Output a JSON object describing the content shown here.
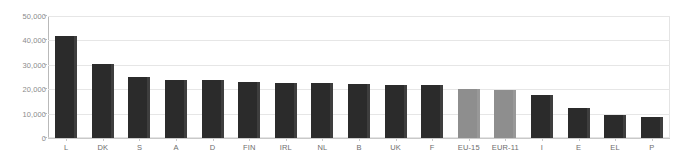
{
  "chart_data": {
    "type": "bar",
    "title": "",
    "subtitle": "",
    "xlabel": "",
    "ylabel": "",
    "ylim": [
      0,
      50000
    ],
    "ytick_labels": [
      "50,000",
      "40,000",
      "30,000",
      "20,000",
      "10,000",
      "0"
    ],
    "ytick_values": [
      50000,
      40000,
      30000,
      20000,
      10000,
      0
    ],
    "grid": true,
    "legend": "none",
    "categories": [
      "L",
      "DK",
      "S",
      "A",
      "D",
      "FIN",
      "IRL",
      "NL",
      "B",
      "UK",
      "F",
      "EU-15",
      "EUR-11",
      "I",
      "E",
      "EL",
      "P"
    ],
    "values": [
      42000,
      30500,
      25000,
      23800,
      23600,
      22800,
      22700,
      22600,
      22100,
      21800,
      21600,
      20200,
      19800,
      17700,
      12400,
      9400,
      8800
    ],
    "bar_colors": [
      "dark",
      "dark",
      "dark",
      "dark",
      "dark",
      "dark",
      "dark",
      "dark",
      "dark",
      "dark",
      "dark",
      "gray",
      "gray",
      "dark",
      "dark",
      "dark",
      "dark"
    ],
    "colors": {
      "bar_dark": "#2b2b2b",
      "bar_gray": "#8e8e8e",
      "gridline": "#e6e6e6",
      "axis": "#b9b9b9",
      "tick_text": "#8b8b8b",
      "category_text": "#6e6e6e",
      "background": "#ffffff"
    }
  }
}
